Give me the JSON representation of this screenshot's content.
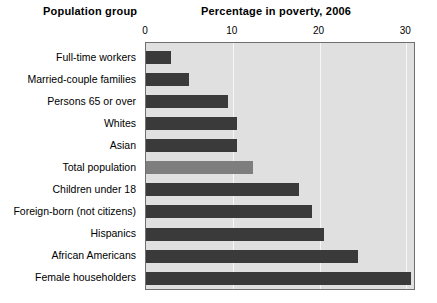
{
  "headers": {
    "group_header": "Population group",
    "value_header": "Percentage in poverty, 2006"
  },
  "colors": {
    "bar": "#3a3a3a",
    "highlight_bar": "#7e7e7e",
    "plot_background": "#e0e0e0",
    "gridline": "#f7f7f7",
    "plot_border": "#6f6f6f",
    "page_background": "#ffffff"
  },
  "chart_data": {
    "type": "bar",
    "orientation": "horizontal",
    "title": "Percentage in poverty, 2006",
    "xlabel": "Percentage in poverty, 2006",
    "ylabel": "Population group",
    "xlim": [
      0,
      31
    ],
    "xticks": [
      0,
      10,
      20,
      30
    ],
    "xtick_labels": [
      "0",
      "10",
      "20",
      "30"
    ],
    "grid": true,
    "grid_axis": "x",
    "legend": false,
    "categories": [
      "Full-time workers",
      "Married-couple families",
      "Persons 65 or over",
      "Whites",
      "Asian",
      "Total population",
      "Children under 18",
      "Foreign-born (not citizens)",
      "Hispanics",
      "African Americans",
      "Female householders"
    ],
    "values": [
      2.9,
      4.9,
      9.4,
      10.5,
      10.5,
      12.3,
      17.6,
      19.1,
      20.5,
      24.4,
      30.5
    ],
    "highlight_index": 5,
    "highlight_category": "Total population"
  }
}
